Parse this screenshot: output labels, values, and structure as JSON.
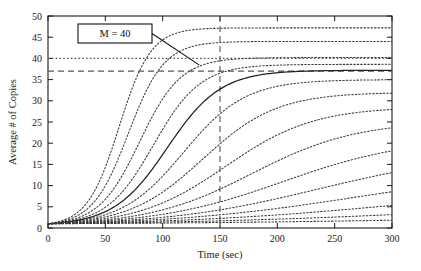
{
  "chart_data": {
    "type": "line",
    "title": "",
    "xlabel": "Time (sec)",
    "ylabel": "Average # of Copies",
    "xlim": [
      0,
      300
    ],
    "ylim": [
      0,
      50
    ],
    "xticks": [
      0,
      50,
      100,
      150,
      200,
      250,
      300
    ],
    "yticks": [
      0,
      5,
      10,
      15,
      20,
      25,
      30,
      35,
      40,
      45,
      50
    ],
    "grid": false,
    "legend": "none",
    "annotations": [
      {
        "name": "m-label",
        "text": "M = 40",
        "x_data": 45,
        "y_data": 44.5,
        "points_to_x": 132,
        "points_to_y": 38.4
      }
    ],
    "reference_lines": [
      {
        "name": "capacity-line",
        "orientation": "horizontal",
        "value": 40,
        "style": "dotted"
      },
      {
        "name": "threshold-line",
        "orientation": "horizontal",
        "value": 37,
        "style": "dashed"
      },
      {
        "name": "time-marker-line",
        "orientation": "vertical",
        "value": 150,
        "style": "dashed"
      }
    ],
    "series": [
      {
        "name": "curve-1",
        "style": "dotted",
        "y0": 1.0,
        "rate": 0.072,
        "cap": 47.2,
        "t50": 62
      },
      {
        "name": "curve-2",
        "style": "dotted",
        "y0": 1.0,
        "rate": 0.064,
        "cap": 44.0,
        "t50": 70
      },
      {
        "name": "curve-3",
        "style": "dotted",
        "y0": 1.0,
        "rate": 0.056,
        "cap": 40.2,
        "t50": 80
      },
      {
        "name": "curve-4",
        "style": "dotted",
        "y0": 1.0,
        "rate": 0.049,
        "cap": 38.6,
        "t50": 92
      },
      {
        "name": "curve-5-solid",
        "style": "solid",
        "y0": 1.0,
        "rate": 0.043,
        "cap": 37.2,
        "t50": 104
      },
      {
        "name": "curve-6",
        "style": "dotted",
        "y0": 1.0,
        "rate": 0.037,
        "cap": 35.0,
        "t50": 118
      },
      {
        "name": "curve-7",
        "style": "dotted",
        "y0": 1.0,
        "rate": 0.031,
        "cap": 32.0,
        "t50": 135
      },
      {
        "name": "curve-8",
        "style": "dotted",
        "y0": 1.0,
        "rate": 0.026,
        "cap": 28.6,
        "t50": 155
      },
      {
        "name": "curve-9",
        "style": "dotted",
        "y0": 1.0,
        "rate": 0.022,
        "cap": 25.2,
        "t50": 178
      },
      {
        "name": "curve-10",
        "style": "dotted",
        "y0": 1.0,
        "rate": 0.018,
        "cap": 21.4,
        "t50": 205
      },
      {
        "name": "curve-11",
        "style": "dotted",
        "y0": 1.0,
        "rate": 0.015,
        "cap": 17.8,
        "t50": 235
      },
      {
        "name": "curve-12",
        "style": "dotted",
        "y0": 1.0,
        "rate": 0.012,
        "cap": 14.2,
        "t50": 270
      },
      {
        "name": "curve-13",
        "style": "dotted",
        "y0": 1.0,
        "rate": 0.0098,
        "cap": 10.6,
        "t50": 310
      },
      {
        "name": "curve-14",
        "style": "dotted",
        "y0": 1.0,
        "rate": 0.0078,
        "cap": 7.2,
        "t50": 360
      },
      {
        "name": "curve-15",
        "style": "dotted",
        "y0": 1.0,
        "rate": 0.006,
        "cap": 4.2,
        "t50": 430
      }
    ],
    "colors": {
      "axis": "#1a1a1a",
      "curve": "#3a3a3a",
      "solid_curve": "#222222",
      "reference": "#555555",
      "background": "#ffffff"
    }
  }
}
